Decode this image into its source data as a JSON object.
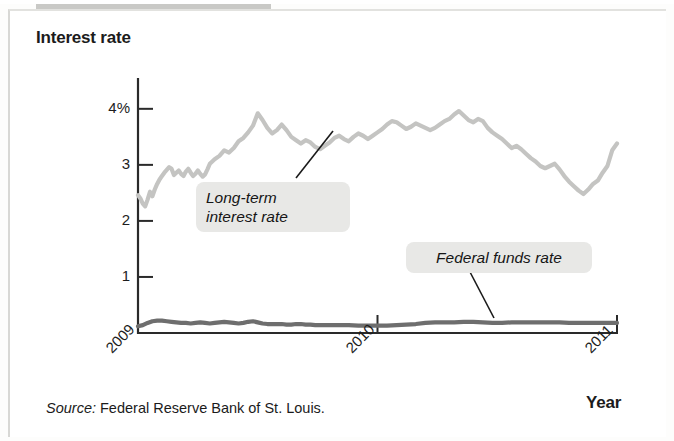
{
  "figure": {
    "source_prefix": "Source:",
    "source_text": " Federal Reserve Bank of St. Louis."
  },
  "chart_data": {
    "type": "line",
    "title": "",
    "ylabel": "Interest rate",
    "xlabel": "Year",
    "ylim": [
      0,
      4.55
    ],
    "xlim": [
      2009.0,
      2011.0
    ],
    "yticks": [
      1,
      2,
      3,
      4
    ],
    "ytick_labels": [
      "1",
      "2",
      "3",
      "4%"
    ],
    "xticks": [
      2009,
      2010,
      2011
    ],
    "xtick_labels": [
      "2009",
      "2010",
      "2011"
    ],
    "grid": false,
    "legend_position": "inline-callouts",
    "annotations": [
      {
        "name": "long-term-callout",
        "text": "Long-term\ninterest rate"
      },
      {
        "name": "federal-funds-callout",
        "text": "Federal funds rate"
      }
    ],
    "series": [
      {
        "name": "Long-term interest rate",
        "color": "#c4c4c2",
        "x": [
          2009.0,
          2009.01,
          2009.02,
          2009.03,
          2009.04,
          2009.05,
          2009.06,
          2009.07,
          2009.08,
          2009.09,
          2009.1,
          2009.11,
          2009.12,
          2009.13,
          2009.14,
          2009.15,
          2009.16,
          2009.17,
          2009.18,
          2009.19,
          2009.2,
          2009.21,
          2009.22,
          2009.23,
          2009.24,
          2009.25,
          2009.26,
          2009.27,
          2009.28,
          2009.29,
          2009.3,
          2009.32,
          2009.34,
          2009.36,
          2009.38,
          2009.4,
          2009.42,
          2009.44,
          2009.46,
          2009.48,
          2009.5,
          2009.52,
          2009.54,
          2009.56,
          2009.58,
          2009.6,
          2009.62,
          2009.64,
          2009.66,
          2009.68,
          2009.7,
          2009.72,
          2009.74,
          2009.76,
          2009.78,
          2009.8,
          2009.82,
          2009.84,
          2009.86,
          2009.88,
          2009.9,
          2009.92,
          2009.94,
          2009.96,
          2009.98,
          2010.0,
          2010.02,
          2010.04,
          2010.06,
          2010.08,
          2010.1,
          2010.12,
          2010.14,
          2010.16,
          2010.18,
          2010.2,
          2010.22,
          2010.24,
          2010.26,
          2010.28,
          2010.3,
          2010.32,
          2010.34,
          2010.36,
          2010.38,
          2010.4,
          2010.42,
          2010.44,
          2010.46,
          2010.48,
          2010.5,
          2010.52,
          2010.54,
          2010.56,
          2010.58,
          2010.6,
          2010.62,
          2010.64,
          2010.66,
          2010.68,
          2010.7,
          2010.72,
          2010.74,
          2010.76,
          2010.78,
          2010.8,
          2010.82,
          2010.84,
          2010.86,
          2010.88,
          2010.9,
          2010.92,
          2010.94,
          2010.96,
          2010.98,
          2011.0
        ],
        "y": [
          2.46,
          2.4,
          2.31,
          2.26,
          2.38,
          2.52,
          2.44,
          2.56,
          2.66,
          2.74,
          2.8,
          2.86,
          2.91,
          2.96,
          2.93,
          2.82,
          2.86,
          2.9,
          2.84,
          2.8,
          2.88,
          2.93,
          2.86,
          2.8,
          2.84,
          2.9,
          2.84,
          2.79,
          2.83,
          2.92,
          3.02,
          3.1,
          3.16,
          3.26,
          3.22,
          3.3,
          3.42,
          3.48,
          3.58,
          3.7,
          3.92,
          3.8,
          3.66,
          3.56,
          3.62,
          3.72,
          3.62,
          3.5,
          3.44,
          3.38,
          3.44,
          3.4,
          3.32,
          3.28,
          3.34,
          3.4,
          3.48,
          3.52,
          3.46,
          3.42,
          3.5,
          3.56,
          3.52,
          3.46,
          3.52,
          3.58,
          3.64,
          3.72,
          3.78,
          3.76,
          3.7,
          3.64,
          3.68,
          3.74,
          3.7,
          3.66,
          3.62,
          3.66,
          3.72,
          3.78,
          3.82,
          3.9,
          3.96,
          3.88,
          3.8,
          3.76,
          3.82,
          3.78,
          3.66,
          3.58,
          3.52,
          3.46,
          3.38,
          3.3,
          3.34,
          3.28,
          3.2,
          3.12,
          3.06,
          2.98,
          2.94,
          2.98,
          3.02,
          2.92,
          2.8,
          2.7,
          2.62,
          2.54,
          2.48,
          2.56,
          2.66,
          2.72,
          2.86,
          2.98,
          3.26,
          3.38
        ]
      },
      {
        "name": "Federal funds rate",
        "color": "#6e6e6e",
        "x": [
          2009.0,
          2009.02,
          2009.04,
          2009.06,
          2009.08,
          2009.1,
          2009.12,
          2009.14,
          2009.16,
          2009.18,
          2009.2,
          2009.22,
          2009.24,
          2009.26,
          2009.28,
          2009.3,
          2009.32,
          2009.34,
          2009.36,
          2009.38,
          2009.4,
          2009.42,
          2009.44,
          2009.46,
          2009.48,
          2009.5,
          2009.52,
          2009.54,
          2009.56,
          2009.58,
          2009.6,
          2009.62,
          2009.64,
          2009.66,
          2009.68,
          2009.7,
          2009.72,
          2009.74,
          2009.76,
          2009.78,
          2009.8,
          2009.84,
          2009.88,
          2009.92,
          2009.96,
          2010.0,
          2010.04,
          2010.08,
          2010.12,
          2010.16,
          2010.2,
          2010.24,
          2010.28,
          2010.32,
          2010.36,
          2010.4,
          2010.44,
          2010.48,
          2010.52,
          2010.56,
          2010.6,
          2010.64,
          2010.68,
          2010.72,
          2010.76,
          2010.8,
          2010.84,
          2010.88,
          2010.92,
          2010.96,
          2011.0
        ],
        "y": [
          0.12,
          0.14,
          0.18,
          0.21,
          0.22,
          0.22,
          0.21,
          0.2,
          0.19,
          0.18,
          0.18,
          0.17,
          0.18,
          0.19,
          0.18,
          0.17,
          0.18,
          0.19,
          0.2,
          0.19,
          0.18,
          0.17,
          0.18,
          0.2,
          0.21,
          0.19,
          0.17,
          0.16,
          0.16,
          0.16,
          0.16,
          0.15,
          0.15,
          0.16,
          0.16,
          0.15,
          0.15,
          0.14,
          0.14,
          0.14,
          0.14,
          0.14,
          0.14,
          0.13,
          0.13,
          0.13,
          0.13,
          0.14,
          0.15,
          0.16,
          0.18,
          0.19,
          0.19,
          0.19,
          0.2,
          0.2,
          0.19,
          0.18,
          0.18,
          0.19,
          0.19,
          0.19,
          0.19,
          0.19,
          0.19,
          0.18,
          0.18,
          0.18,
          0.18,
          0.18,
          0.18
        ]
      }
    ]
  }
}
